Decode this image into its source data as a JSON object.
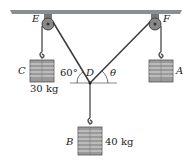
{
  "diagram": {
    "type": "statics pulley system",
    "points": {
      "E": "E",
      "F": "F",
      "D": "D"
    },
    "masses": {
      "C": {
        "label": "C",
        "mass": "30 kg"
      },
      "A": {
        "label": "A"
      },
      "B": {
        "label": "B",
        "mass": "40 kg"
      }
    },
    "angles": {
      "left": "60°",
      "right": "θ"
    },
    "colors": {
      "ceiling": "#8a8f94",
      "cable": "#3a3a3a",
      "weight": "#9a9a9a"
    }
  }
}
